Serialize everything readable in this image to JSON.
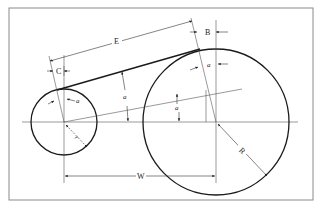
{
  "diagram": {
    "labels": {
      "E": "E",
      "B": "B",
      "C": "C",
      "W": "W",
      "R": "R",
      "r": "r",
      "a_small_circle": "a",
      "a_mid_left": "a",
      "a_mid_right": "a",
      "a_large_circle": "a"
    },
    "colors": {
      "frame": "#8a8a8a",
      "stroke": "#1a1a1a",
      "thin": "#444444",
      "background": "#ffffff"
    }
  }
}
